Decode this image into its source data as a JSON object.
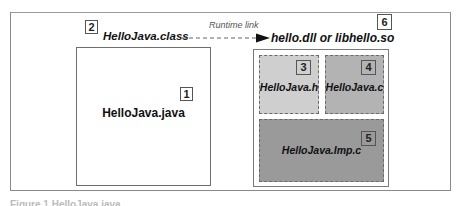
{
  "diagram": {
    "components": [
      {
        "id": 1,
        "badge": "1",
        "label": "HelloJava.java",
        "fill": "#ffffff"
      },
      {
        "id": 2,
        "badge": "2",
        "label": "HelloJava.class"
      },
      {
        "id": 3,
        "badge": "3",
        "label": "HelloJava.h",
        "fill": "#cfcfcf"
      },
      {
        "id": 4,
        "badge": "4",
        "label": "HelloJava.c",
        "fill": "#b3b3b3"
      },
      {
        "id": 5,
        "badge": "5",
        "label": "HelloJava.Imp.c",
        "fill": "#9a9a9a"
      },
      {
        "id": 6,
        "badge": "6",
        "label": "hello.dll or libhello.so",
        "fill": "#ffffff"
      }
    ],
    "edges": [
      {
        "from": "HelloJava.class",
        "to": "hello.dll or libhello.so",
        "label": "Runtime link",
        "style": "dashed-arrow"
      }
    ],
    "caption": "Figure 1  HelloJava.java"
  }
}
